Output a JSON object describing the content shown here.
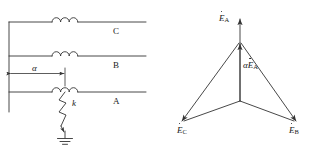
{
  "figure": {
    "stroke_color": "#333333",
    "background_color": "#ffffff"
  },
  "circuit": {
    "name": "three-phase transmission line schematic",
    "phase_lines": [
      {
        "id": "C",
        "label": "C",
        "inductor": "coil-symbol"
      },
      {
        "id": "B",
        "label": "B",
        "inductor": "coil-symbol"
      },
      {
        "id": "A",
        "label": "A",
        "inductor": "coil-symbol"
      }
    ],
    "fault": {
      "label": "k",
      "type": "short-circuit-to-ground",
      "symbol": "zigzag-arrow",
      "ground_symbol": "earth-ground"
    },
    "dimension": {
      "label": "α",
      "description": "fault distance along line from bus"
    },
    "bus_symbol": "vertical-busbar"
  },
  "phasor": {
    "name": "phasor diagram of phase EMFs",
    "vectors": [
      {
        "id": "EA",
        "label": "E",
        "subscript": "A",
        "dotted": true,
        "prefix": "",
        "direction": "up"
      },
      {
        "id": "alphaEA",
        "label": "E",
        "subscript": "A",
        "dotted": true,
        "prefix": "α",
        "direction": "up-partial"
      },
      {
        "id": "EB",
        "label": "E",
        "subscript": "B",
        "dotted": true,
        "prefix": "",
        "direction": "lower-right"
      },
      {
        "id": "EC",
        "label": "E",
        "subscript": "C",
        "dotted": true,
        "prefix": "",
        "direction": "lower-left"
      }
    ],
    "neutral_point": "star-point"
  }
}
